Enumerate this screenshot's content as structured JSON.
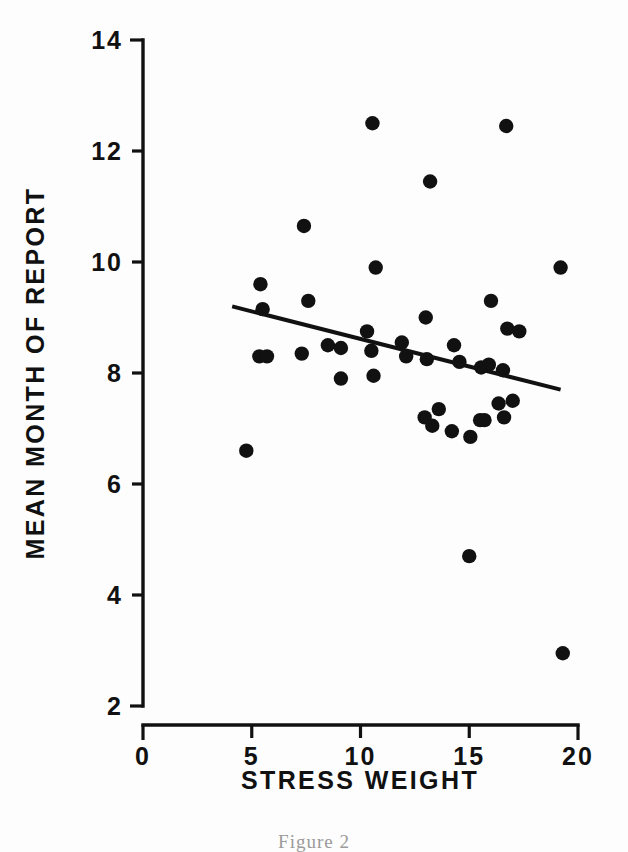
{
  "figure": {
    "caption": "Figure 2",
    "background_color": "#fdfdfd",
    "ink_color": "#111111"
  },
  "chart_data": {
    "type": "scatter",
    "title": "",
    "subtitle": "",
    "xlabel": "STRESS WEIGHT",
    "ylabel": "MEAN MONTH OF REPORT",
    "xlim": [
      0,
      20
    ],
    "ylim": [
      2,
      14
    ],
    "xticks": [
      0,
      5,
      10,
      15,
      20
    ],
    "yticks": [
      2,
      4,
      6,
      8,
      10,
      12,
      14
    ],
    "xtick_labels": [
      "0",
      "5",
      "10",
      "15",
      "20"
    ],
    "ytick_labels": [
      "2",
      "4",
      "6",
      "8",
      "10",
      "12",
      "14"
    ],
    "grid": false,
    "legend": null,
    "marker": "filled-circle",
    "marker_color": "#111111",
    "points": [
      {
        "x": 4.75,
        "y": 6.6
      },
      {
        "x": 5.4,
        "y": 9.6
      },
      {
        "x": 5.5,
        "y": 9.15
      },
      {
        "x": 5.35,
        "y": 8.3
      },
      {
        "x": 5.7,
        "y": 8.3
      },
      {
        "x": 7.4,
        "y": 10.65
      },
      {
        "x": 7.6,
        "y": 9.3
      },
      {
        "x": 7.3,
        "y": 8.35
      },
      {
        "x": 8.5,
        "y": 8.5
      },
      {
        "x": 9.1,
        "y": 8.45
      },
      {
        "x": 9.1,
        "y": 7.9
      },
      {
        "x": 10.55,
        "y": 12.5
      },
      {
        "x": 10.3,
        "y": 8.75
      },
      {
        "x": 10.7,
        "y": 9.9
      },
      {
        "x": 10.5,
        "y": 8.4
      },
      {
        "x": 10.6,
        "y": 7.95
      },
      {
        "x": 11.9,
        "y": 8.55
      },
      {
        "x": 12.1,
        "y": 8.3
      },
      {
        "x": 13.2,
        "y": 11.45
      },
      {
        "x": 13.0,
        "y": 9.0
      },
      {
        "x": 13.05,
        "y": 8.25
      },
      {
        "x": 12.95,
        "y": 7.2
      },
      {
        "x": 13.3,
        "y": 7.05
      },
      {
        "x": 13.6,
        "y": 7.35
      },
      {
        "x": 14.2,
        "y": 6.95
      },
      {
        "x": 14.3,
        "y": 8.5
      },
      {
        "x": 14.55,
        "y": 8.2
      },
      {
        "x": 15.0,
        "y": 4.7
      },
      {
        "x": 15.05,
        "y": 6.85
      },
      {
        "x": 15.5,
        "y": 7.15
      },
      {
        "x": 15.7,
        "y": 7.15
      },
      {
        "x": 15.55,
        "y": 8.1
      },
      {
        "x": 15.9,
        "y": 8.15
      },
      {
        "x": 16.0,
        "y": 9.3
      },
      {
        "x": 16.35,
        "y": 7.45
      },
      {
        "x": 16.55,
        "y": 8.05
      },
      {
        "x": 16.7,
        "y": 12.45
      },
      {
        "x": 16.75,
        "y": 8.8
      },
      {
        "x": 16.6,
        "y": 7.2
      },
      {
        "x": 17.0,
        "y": 7.5
      },
      {
        "x": 17.3,
        "y": 8.75
      },
      {
        "x": 19.2,
        "y": 9.9
      },
      {
        "x": 19.3,
        "y": 2.95
      }
    ],
    "trendline": {
      "type": "linear-fit",
      "x_start": 4.1,
      "y_start": 9.2,
      "x_end": 19.2,
      "y_end": 7.7
    }
  }
}
